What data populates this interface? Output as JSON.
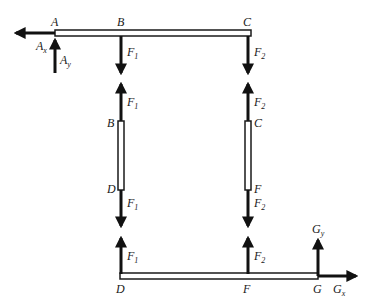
{
  "diagram": {
    "type": "free-body diagram",
    "points": {
      "A": "A",
      "B": "B",
      "C": "C",
      "D": "D",
      "F": "F",
      "G": "G"
    },
    "forces": {
      "Ax": {
        "main": "A",
        "sub": "x"
      },
      "Ay": {
        "main": "A",
        "sub": "y"
      },
      "F1": {
        "main": "F",
        "sub": "1"
      },
      "F2": {
        "main": "F",
        "sub": "2"
      },
      "Gx": {
        "main": "G",
        "sub": "x"
      },
      "Gy": {
        "main": "G",
        "sub": "y"
      }
    },
    "members": [
      "ABC",
      "BD",
      "CF",
      "DFG"
    ],
    "colors": {
      "line": "#1a1a1a",
      "fill": "#ffffff"
    }
  }
}
